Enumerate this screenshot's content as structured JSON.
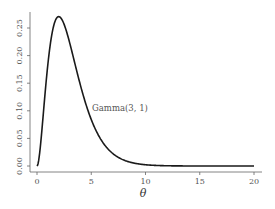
{
  "chart_data": {
    "type": "line",
    "title": "",
    "xlabel": "θ",
    "ylabel": "",
    "xlim": [
      0,
      20
    ],
    "ylim": [
      0,
      0.27
    ],
    "grid": false,
    "legend": null,
    "x_ticks": [
      "0",
      "5",
      "10",
      "15",
      "20"
    ],
    "y_ticks": [
      "0.00",
      "0.05",
      "0.10",
      "0.15",
      "0.20",
      "0.25"
    ],
    "annotations": [
      {
        "text": "Gamma(3, 1)",
        "x": 5,
        "y": 0.11
      }
    ],
    "series": [
      {
        "name": "Gamma(3, 1)",
        "color": "#1a1a1a",
        "x": [
          0,
          0.5,
          1,
          1.5,
          2,
          2.5,
          3,
          3.5,
          4,
          5,
          6,
          7,
          8,
          9,
          10,
          12,
          14,
          16,
          18,
          20
        ],
        "values": [
          0.0,
          0.076,
          0.184,
          0.251,
          0.271,
          0.257,
          0.224,
          0.185,
          0.147,
          0.084,
          0.045,
          0.022,
          0.011,
          0.005,
          0.002,
          0.0004,
          0.0001,
          0.0,
          0.0,
          0.0
        ]
      }
    ]
  },
  "labels": {
    "x_title": "θ",
    "annotation": "Gamma(3, 1)",
    "x_ticks": [
      "0",
      "5",
      "10",
      "15",
      "20"
    ],
    "y_ticks": [
      "0.00",
      "0.05",
      "0.10",
      "0.15",
      "0.20",
      "0.25"
    ]
  }
}
